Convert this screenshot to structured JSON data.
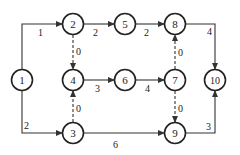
{
  "diagram": {
    "type": "activity-on-arrow network",
    "nodes": [
      {
        "id": "1",
        "label": "1",
        "x": 22,
        "y": 80
      },
      {
        "id": "2",
        "label": "2",
        "x": 73,
        "y": 24
      },
      {
        "id": "3",
        "label": "3",
        "x": 73,
        "y": 133
      },
      {
        "id": "4",
        "label": "4",
        "x": 73,
        "y": 80
      },
      {
        "id": "5",
        "label": "5",
        "x": 125,
        "y": 24
      },
      {
        "id": "6",
        "label": "6",
        "x": 125,
        "y": 80
      },
      {
        "id": "7",
        "label": "7",
        "x": 175,
        "y": 80
      },
      {
        "id": "8",
        "label": "8",
        "x": 175,
        "y": 24
      },
      {
        "id": "9",
        "label": "9",
        "x": 175,
        "y": 133
      },
      {
        "id": "10",
        "label": "10",
        "x": 215,
        "y": 80
      }
    ],
    "edges": [
      {
        "from": "1",
        "to": "2",
        "weight": "1",
        "dummy": false
      },
      {
        "from": "1",
        "to": "3",
        "weight": "2",
        "dummy": false
      },
      {
        "from": "2",
        "to": "5",
        "weight": "2",
        "dummy": false
      },
      {
        "from": "2",
        "to": "4",
        "weight": "0",
        "dummy": true
      },
      {
        "from": "3",
        "to": "4",
        "weight": "0",
        "dummy": true
      },
      {
        "from": "3",
        "to": "9",
        "weight": "6",
        "dummy": false
      },
      {
        "from": "4",
        "to": "6",
        "weight": "3",
        "dummy": false
      },
      {
        "from": "5",
        "to": "8",
        "weight": "2",
        "dummy": false
      },
      {
        "from": "6",
        "to": "7",
        "weight": "4",
        "dummy": false
      },
      {
        "from": "7",
        "to": "8",
        "weight": "0",
        "dummy": true
      },
      {
        "from": "7",
        "to": "9",
        "weight": "0",
        "dummy": true
      },
      {
        "from": "8",
        "to": "10",
        "weight": "4",
        "dummy": false
      },
      {
        "from": "9",
        "to": "10",
        "weight": "3",
        "dummy": false
      }
    ]
  }
}
